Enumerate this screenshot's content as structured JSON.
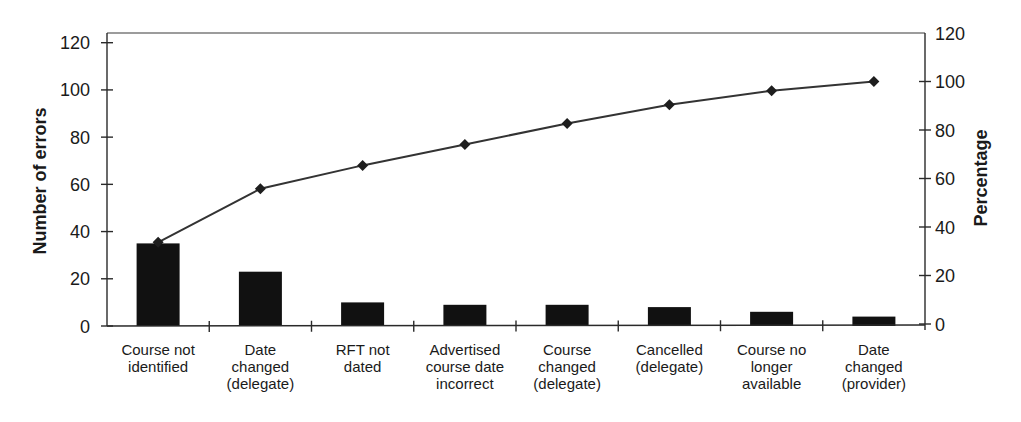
{
  "chart_data": {
    "type": "bar",
    "subtype": "pareto",
    "title": "",
    "categories": [
      "Course not identified",
      "Date changed (delegate)",
      "RFT not dated",
      "Advertised course date incorrect",
      "Course changed (delegate)",
      "Cancelled (delegate)",
      "Course no longer available",
      "Date changed (provider)"
    ],
    "category_lines": [
      [
        "Course not",
        "identified"
      ],
      [
        "Date",
        "changed",
        "(delegate)"
      ],
      [
        "RFT not",
        "dated"
      ],
      [
        "Advertised",
        "course date",
        "incorrect"
      ],
      [
        "Course",
        "changed",
        "(delegate)"
      ],
      [
        "Cancelled",
        "(delegate)"
      ],
      [
        "Course no",
        "longer",
        "available"
      ],
      [
        "Date",
        "changed",
        "(provider)"
      ]
    ],
    "series": [
      {
        "name": "Number of errors",
        "type": "bar",
        "axis": "left",
        "color": "#111111",
        "values": [
          35,
          23,
          10,
          9,
          9,
          8,
          6,
          4
        ]
      },
      {
        "name": "Cumulative percentage",
        "type": "line",
        "axis": "right",
        "marker": "diamond",
        "color": "#333333",
        "values": [
          33.7,
          55.8,
          65.4,
          74.0,
          82.7,
          90.4,
          96.2,
          100
        ]
      }
    ],
    "xlabel": "",
    "ylabel": "Number of errors",
    "y2label": "Percentage",
    "ylim": [
      0,
      120
    ],
    "y2lim": [
      0,
      120
    ],
    "yticks": [
      0,
      20,
      40,
      60,
      80,
      100,
      120
    ],
    "y2ticks": [
      0,
      20,
      40,
      60,
      80,
      100,
      120
    ],
    "grid": false,
    "legend": "none"
  },
  "layout": {
    "plot_left": 107,
    "plot_right": 925,
    "plot_top": 33,
    "left_axis": {
      "zero_y": 326,
      "top_y": 42.7
    },
    "right_axis": {
      "zero_y": 324,
      "top_y": 33
    },
    "bar_width": 43,
    "tick_len": 6,
    "label_top": 355,
    "label_line_height": 17
  }
}
